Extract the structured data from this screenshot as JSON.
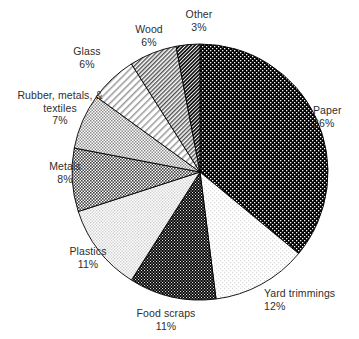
{
  "chart_data": {
    "type": "pie",
    "title": "",
    "subtitle": "",
    "xlabel": "",
    "ylabel": "",
    "legend_position": "none",
    "grid": false,
    "unit": "%",
    "start_angle_deg": 0,
    "direction": "clockwise",
    "categories": [
      "Paper",
      "Yard trimmings",
      "Food scraps",
      "Plastics",
      "Metals",
      "Rubber, metals, & textiles",
      "Glass",
      "Wood",
      "Other"
    ],
    "values": [
      36,
      12,
      11,
      11,
      8,
      7,
      6,
      6,
      3
    ],
    "slices": [
      {
        "name": "Paper",
        "label_line1": "Paper",
        "label_line2": "36%",
        "value": 36,
        "pattern": "black-with-white-dots",
        "fill": "#000000",
        "dot": "#ffffff"
      },
      {
        "name": "Yard trimmings",
        "label_line1": "Yard trimmings",
        "label_line2": "12%",
        "value": 12,
        "pattern": "white-with-light-dots",
        "fill": "#ffffff",
        "dot": "#d7d7d7"
      },
      {
        "name": "Food scraps",
        "label_line1": "Food scraps",
        "label_line2": "11%",
        "value": 11,
        "pattern": "black-dense-dots",
        "fill": "#000000",
        "dot": "#e8e8e8"
      },
      {
        "name": "Plastics",
        "label_line1": "Plastics",
        "label_line2": "11%",
        "value": 11,
        "pattern": "light-gray-checker",
        "fill": "#ffffff",
        "dot": "#d0d0d0"
      },
      {
        "name": "Metals",
        "label_line1": "Metals",
        "label_line2": "8%",
        "value": 8,
        "pattern": "dark-gray-checker",
        "fill": "#ffffff",
        "dot": "#4a4a4a"
      },
      {
        "name": "Rubber, metals, & textiles",
        "label_line1": "Rubber, metals, &",
        "label_line2": "textiles",
        "label_line3": "7%",
        "value": 7,
        "pattern": "medium-gray-checker",
        "fill": "#ffffff",
        "dot": "#8f8f8f"
      },
      {
        "name": "Glass",
        "label_line1": "Glass",
        "label_line2": "6%",
        "value": 6,
        "pattern": "light-diagonal-hatch",
        "fill": "#ffffff",
        "dot": "#909090"
      },
      {
        "name": "Wood",
        "label_line1": "Wood",
        "label_line2": "6%",
        "value": 6,
        "pattern": "dense-diagonal-hatch",
        "fill": "#ffffff",
        "dot": "#555555"
      },
      {
        "name": "Other",
        "label_line1": "Other",
        "label_line2": "3%",
        "value": 3,
        "pattern": "dark-diagonal-hatch",
        "fill": "#ffffff",
        "dot": "#1c1c1c"
      }
    ]
  },
  "labels": {
    "paper": {
      "name": "Paper",
      "pct": "36%"
    },
    "yard": {
      "name": "Yard trimmings",
      "pct": "12%"
    },
    "food": {
      "name": "Food scraps",
      "pct": "11%"
    },
    "plastics": {
      "name": "Plastics",
      "pct": "11%"
    },
    "metals": {
      "name": "Metals",
      "pct": "8%"
    },
    "rubber": {
      "name": "Rubber, metals, &",
      "name2": "textiles",
      "pct": "7%"
    },
    "glass": {
      "name": "Glass",
      "pct": "6%"
    },
    "wood": {
      "name": "Wood",
      "pct": "6%"
    },
    "other": {
      "name": "Other",
      "pct": "3%"
    }
  },
  "colors": {
    "outline": "#000000",
    "text": "#2e2e2e",
    "background": "#ffffff"
  }
}
